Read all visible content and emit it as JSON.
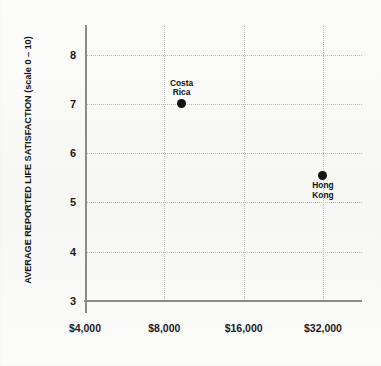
{
  "chart_data": {
    "type": "scatter",
    "title": "",
    "xlabel": "",
    "ylabel": "AVERAGE REPORTED LIFE SATISFACTION (scale 0 – 10)",
    "x_scale": "log2",
    "x_tick_labels": [
      "$4,000",
      "$8,000",
      "$16,000",
      "$32,000"
    ],
    "x_tick_values": [
      4000,
      8000,
      16000,
      32000
    ],
    "y_tick_labels": [
      "8",
      "7",
      "6",
      "5",
      "4",
      "3"
    ],
    "y_tick_values": [
      8,
      7,
      6,
      5,
      4,
      3
    ],
    "ylim": [
      3,
      8.6
    ],
    "xlim": [
      4000,
      45000
    ],
    "grid": true,
    "grid_style": "dotted",
    "legend": "none",
    "points": [
      {
        "label": "Costa\nRica",
        "label_position": "above",
        "x": 9300,
        "y": 7.0,
        "x_display": "$9,300",
        "y_display": "7.0"
      },
      {
        "label": "Hong Kong",
        "label_position": "below",
        "x": 32000,
        "y": 5.55,
        "x_display": "$32,000",
        "y_display": "5.55"
      }
    ],
    "colors": {
      "point": "#121212",
      "axis": "#8a8a8a",
      "grid": "#b9b9b9",
      "text": "#1b1b1b",
      "background": "#fbfbfa"
    }
  },
  "footer": {
    "caption": ""
  }
}
